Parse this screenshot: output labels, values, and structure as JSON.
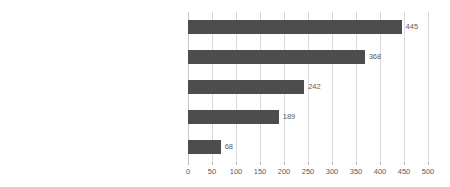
{
  "chart_data": {
    "type": "bar",
    "orientation": "horizontal",
    "title": "",
    "subtitle": "",
    "xlabel": "",
    "ylabel": "",
    "categories": [
      "Critiquing Teacher or School Practices",
      "Critiquing Key Ideas or Revolution School Generally",
      "Raising Issues of School Funding",
      "Critiquing as \"Not Revolutionary\"",
      "Critiquing Ethical Dimensions of Revolution School"
    ],
    "values": [
      445,
      368,
      242,
      189,
      68
    ],
    "data_labels": [
      "445",
      "368",
      "242",
      "189",
      "68"
    ],
    "xlim": [
      0,
      500
    ],
    "xticks": [
      0,
      50,
      100,
      150,
      200,
      250,
      300,
      350,
      400,
      450,
      500
    ],
    "xtick_labels": [
      "0",
      "50",
      "100",
      "150",
      "200",
      "250",
      "300",
      "350",
      "400",
      "450",
      "500"
    ],
    "grid": true,
    "grid_axis": "x",
    "legend": false,
    "bar_color": "#4d4d4d",
    "gridline_color": "#d9d9d9",
    "background_color": "#ffffff",
    "label_color": "#4a4a4a",
    "value_label_color": "#5a5a5a"
  }
}
